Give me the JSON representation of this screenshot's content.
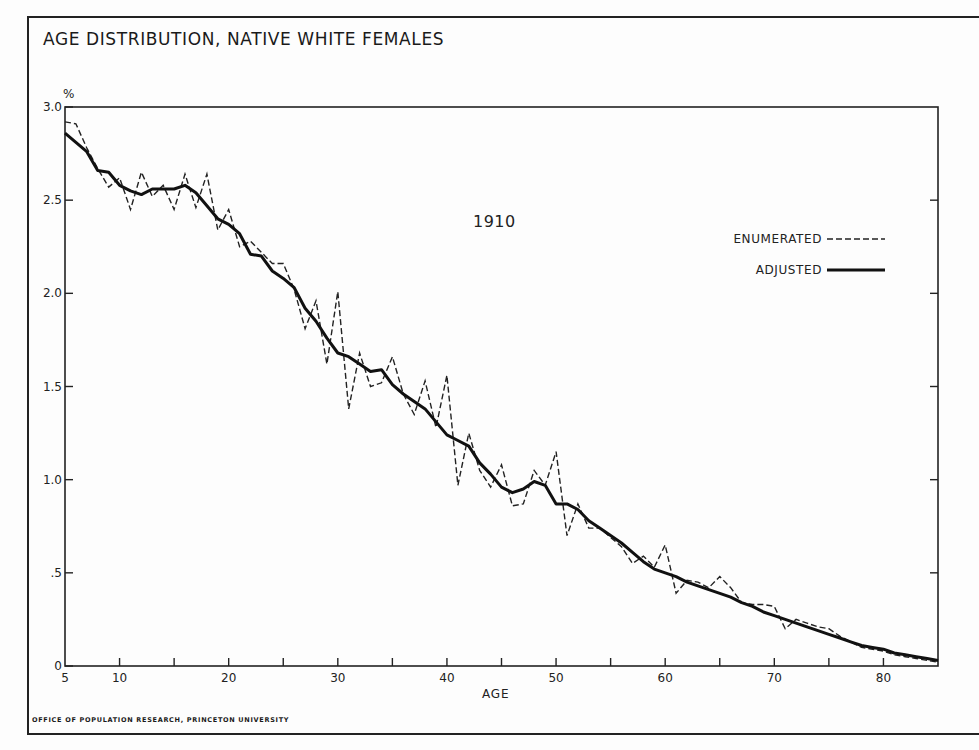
{
  "title": "AGE DISTRIBUTION, NATIVE WHITE FEMALES",
  "credit": "OFFICE OF POPULATION RESEARCH, PRINCETON UNIVERSITY",
  "year_label": "1910",
  "y_unit": "%",
  "x_axis_label": "AGE",
  "legend": {
    "enumerated": "ENUMERATED",
    "adjusted": "ADJUSTED"
  },
  "y_ticks": [
    "3.0",
    "2.5",
    "2.0",
    "1.5",
    "1.0",
    ".5",
    "0"
  ],
  "x_ticks": [
    "5",
    "10",
    "20",
    "30",
    "40",
    "50",
    "60",
    "70",
    "80"
  ],
  "chart_data": {
    "type": "line",
    "title": "AGE DISTRIBUTION, NATIVE WHITE FEMALES",
    "subtitle": "1910",
    "xlabel": "AGE",
    "ylabel": "%",
    "xlim": [
      5,
      85
    ],
    "ylim": [
      0,
      3.0
    ],
    "grid": false,
    "legend_position": "upper right",
    "x_tick_labels": [
      "5",
      "10",
      "20",
      "30",
      "40",
      "50",
      "60",
      "70",
      "80"
    ],
    "y_tick_labels": [
      "0",
      ".5",
      "1.0",
      "1.5",
      "2.0",
      "2.5",
      "3.0"
    ],
    "x": [
      5,
      6,
      7,
      8,
      9,
      10,
      11,
      12,
      13,
      14,
      15,
      16,
      17,
      18,
      19,
      20,
      21,
      22,
      23,
      24,
      25,
      26,
      27,
      28,
      29,
      30,
      31,
      32,
      33,
      34,
      35,
      36,
      37,
      38,
      39,
      40,
      41,
      42,
      43,
      44,
      45,
      46,
      47,
      48,
      49,
      50,
      51,
      52,
      53,
      54,
      55,
      56,
      57,
      58,
      59,
      60,
      61,
      62,
      63,
      64,
      65,
      66,
      67,
      68,
      69,
      70,
      71,
      72,
      73,
      74,
      75,
      76,
      77,
      78,
      79,
      80,
      81,
      82,
      83,
      84,
      85
    ],
    "series": [
      {
        "name": "ENUMERATED",
        "style": "dashed",
        "values": [
          2.92,
          2.91,
          2.78,
          2.67,
          2.57,
          2.62,
          2.45,
          2.65,
          2.52,
          2.58,
          2.45,
          2.64,
          2.46,
          2.64,
          2.34,
          2.45,
          2.25,
          2.28,
          2.22,
          2.16,
          2.16,
          2.02,
          1.81,
          1.96,
          1.62,
          2.01,
          1.38,
          1.68,
          1.5,
          1.52,
          1.66,
          1.46,
          1.35,
          1.53,
          1.28,
          1.56,
          0.97,
          1.25,
          1.05,
          0.96,
          1.08,
          0.86,
          0.87,
          1.05,
          0.97,
          1.15,
          0.7,
          0.87,
          0.74,
          0.74,
          0.69,
          0.64,
          0.55,
          0.59,
          0.53,
          0.65,
          0.39,
          0.46,
          0.45,
          0.42,
          0.48,
          0.42,
          0.34,
          0.33,
          0.33,
          0.32,
          0.2,
          0.25,
          0.23,
          0.21,
          0.2,
          0.16,
          0.13,
          0.1,
          0.09,
          0.08,
          0.06,
          0.05,
          0.04,
          0.03,
          0.02
        ]
      },
      {
        "name": "ADJUSTED",
        "style": "solid",
        "values": [
          2.86,
          2.81,
          2.76,
          2.66,
          2.65,
          2.58,
          2.55,
          2.53,
          2.56,
          2.56,
          2.56,
          2.58,
          2.54,
          2.47,
          2.4,
          2.37,
          2.32,
          2.21,
          2.2,
          2.12,
          2.08,
          2.03,
          1.92,
          1.85,
          1.76,
          1.68,
          1.66,
          1.62,
          1.58,
          1.59,
          1.51,
          1.46,
          1.42,
          1.38,
          1.31,
          1.24,
          1.21,
          1.18,
          1.09,
          1.03,
          0.96,
          0.93,
          0.95,
          0.99,
          0.97,
          0.87,
          0.87,
          0.84,
          0.78,
          0.74,
          0.7,
          0.66,
          0.61,
          0.56,
          0.52,
          0.5,
          0.48,
          0.45,
          0.43,
          0.41,
          0.39,
          0.37,
          0.34,
          0.32,
          0.29,
          0.27,
          0.25,
          0.23,
          0.21,
          0.19,
          0.17,
          0.15,
          0.13,
          0.11,
          0.1,
          0.09,
          0.07,
          0.06,
          0.05,
          0.04,
          0.03
        ]
      }
    ],
    "annotations": [
      "1910"
    ]
  }
}
